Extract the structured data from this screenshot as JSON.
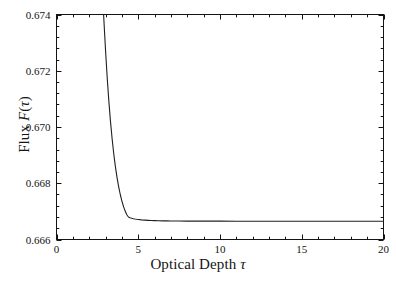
{
  "chart_data": {
    "type": "line",
    "title": "",
    "xlabel": "Optical Depth τ",
    "ylabel": "Flux F(τ)",
    "xlim": [
      0,
      20
    ],
    "ylim": [
      0.666,
      0.674
    ],
    "grid": false,
    "legend": null,
    "line_color": "#202020",
    "background": "#ffffff",
    "frame": "box",
    "xticks": [
      0,
      5,
      10,
      15,
      20
    ],
    "xtick_labels": [
      "0",
      "5",
      "10",
      "15",
      "20"
    ],
    "x_minor_tick_step": 1,
    "yticks": [
      0.666,
      0.668,
      0.67,
      0.672,
      0.674
    ],
    "ytick_labels": [
      "0.666",
      "0.668",
      "0.670",
      "0.672",
      "0.674"
    ],
    "y_minor_tick_step": 0.0004,
    "asymptote": 0.66665,
    "series": [
      {
        "name": "Flux",
        "x": [
          2.88,
          3.0,
          3.1,
          3.2,
          3.3,
          3.4,
          3.5,
          3.6,
          3.7,
          3.8,
          3.9,
          4.0,
          4.1,
          4.2,
          4.3,
          4.4,
          4.5,
          4.6,
          4.7,
          4.8,
          4.9,
          5.0,
          5.2,
          5.4,
          5.6,
          5.8,
          6.0,
          6.25,
          6.5,
          6.75,
          7.0,
          7.5,
          8.0,
          8.5,
          9.0,
          9.5,
          10.0,
          11.0,
          12.0,
          13.0,
          14.0,
          15.0,
          16.0,
          17.0,
          18.0,
          19.0,
          20.0
        ],
        "y": [
          0.674,
          0.67272,
          0.67176,
          0.67093,
          0.67021,
          0.66959,
          0.66906,
          0.6686,
          0.66821,
          0.66788,
          0.6676,
          0.667365,
          0.66717,
          0.66701,
          0.66688,
          0.6668,
          0.666775,
          0.666755,
          0.66674,
          0.666728,
          0.666718,
          0.66671,
          0.666697,
          0.666688,
          0.666681,
          0.666675,
          0.666671,
          0.666667,
          0.666664,
          0.666662,
          0.66666,
          0.666657,
          0.666655,
          0.666654,
          0.666653,
          0.666652,
          0.666652,
          0.666651,
          0.666651,
          0.66665,
          0.66665,
          0.66665,
          0.66665,
          0.66665,
          0.66665,
          0.66665,
          0.66665
        ]
      }
    ]
  },
  "axes": {
    "x_title_prefix": "Optical Depth ",
    "x_title_symbol": "τ",
    "y_title_prefix": "Flux ",
    "y_title_var": "F",
    "y_title_arg_open": "(",
    "y_title_symbol": "τ",
    "y_title_arg_close": ")"
  }
}
